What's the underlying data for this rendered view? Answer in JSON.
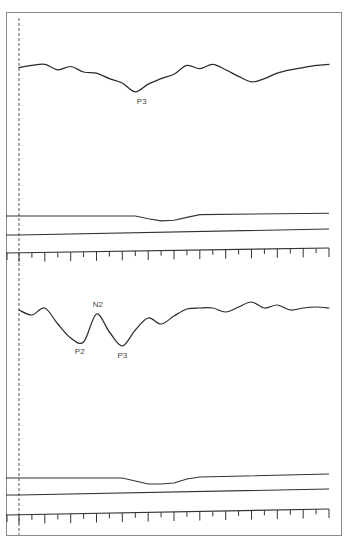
{
  "chart_data": {
    "type": "line",
    "title": "",
    "xlabel": "",
    "ylabel": "",
    "grid": false,
    "legend": "none",
    "x_unit": "ruler ticks (major every 2 minor)",
    "x_range": [
      0,
      24
    ],
    "panels": [
      {
        "id": "top",
        "series": [
          {
            "name": "evoked-waveform",
            "x": [
              0,
              1,
              2,
              3,
              4,
              5,
              6,
              7,
              8,
              9,
              10,
              11,
              12,
              13,
              14,
              15,
              16,
              17,
              18,
              19,
              20,
              21,
              22,
              23,
              24
            ],
            "y": [
              0.2,
              0.3,
              0.35,
              0.1,
              0.25,
              0.0,
              -0.05,
              -0.3,
              -0.5,
              -0.9,
              -0.55,
              -0.3,
              -0.1,
              0.3,
              0.15,
              0.35,
              0.1,
              -0.2,
              -0.45,
              -0.3,
              -0.05,
              0.1,
              0.2,
              0.3,
              0.35
            ]
          },
          {
            "name": "baseline-channel-1",
            "x": [
              0,
              9,
              10,
              11,
              12,
              13,
              14,
              24
            ],
            "y": [
              0,
              0,
              -0.2,
              -0.35,
              -0.3,
              -0.1,
              0.1,
              0.2
            ]
          },
          {
            "name": "baseline-channel-2",
            "x": [
              0,
              24
            ],
            "y": [
              0,
              0.2
            ]
          }
        ],
        "annotations": [
          {
            "text": "P3",
            "x": 9.5,
            "target": "trough"
          }
        ]
      },
      {
        "id": "bottom",
        "series": [
          {
            "name": "evoked-waveform",
            "x": [
              0,
              1,
              2,
              3,
              4,
              5,
              6,
              7,
              8,
              9,
              10,
              11,
              12,
              13,
              14,
              15,
              16,
              17,
              18,
              19,
              20,
              21,
              22,
              23,
              24
            ],
            "y": [
              0.3,
              0.05,
              0.4,
              -0.4,
              -1.1,
              -1.3,
              0.1,
              -0.8,
              -1.5,
              -0.7,
              -0.1,
              -0.4,
              0.0,
              0.35,
              0.4,
              0.4,
              0.2,
              0.45,
              0.7,
              0.4,
              0.55,
              0.3,
              0.4,
              0.45,
              0.4
            ]
          },
          {
            "name": "baseline-channel-1",
            "x": [
              0,
              8,
              9,
              10,
              11,
              12,
              13,
              14,
              24
            ],
            "y": [
              0,
              0,
              -0.15,
              -0.3,
              -0.3,
              -0.25,
              -0.05,
              0.05,
              0.2
            ]
          },
          {
            "name": "baseline-channel-2",
            "x": [
              0,
              24
            ],
            "y": [
              0,
              0.2
            ]
          }
        ],
        "annotations": [
          {
            "text": "P2",
            "x": 4.7,
            "target": "trough"
          },
          {
            "text": "N2",
            "x": 6.1,
            "target": "peak"
          },
          {
            "text": "P3",
            "x": 8.0,
            "target": "trough"
          }
        ]
      }
    ],
    "ruler": {
      "ticks": 24,
      "major_every": 2
    },
    "stimulus_marker": {
      "style": "dashed-vertical",
      "x": 0
    }
  }
}
